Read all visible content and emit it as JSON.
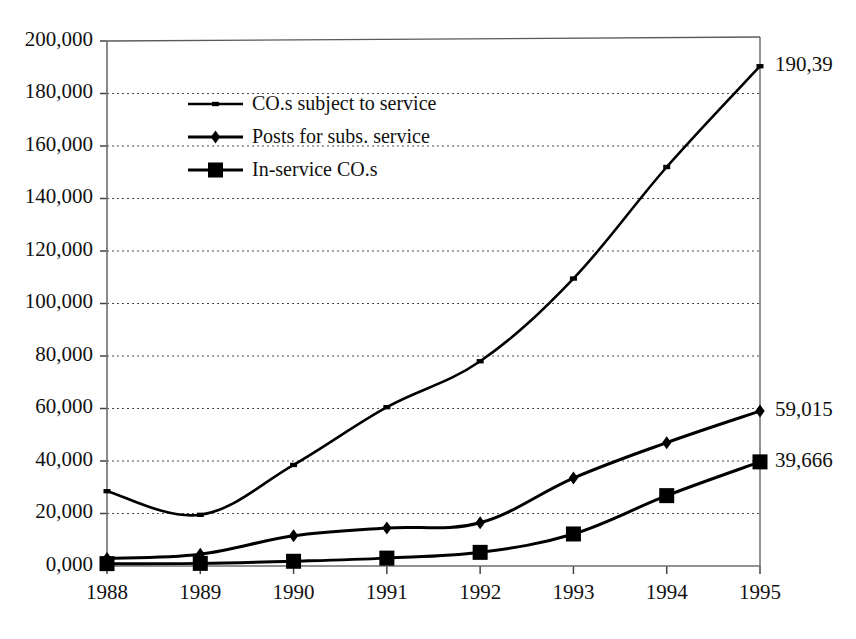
{
  "chart_data": {
    "type": "line",
    "title": "",
    "subtitle": "",
    "xlabel": "",
    "ylabel": "",
    "x": [
      "1988",
      "1989",
      "1990",
      "1991",
      "1992",
      "1993",
      "1994",
      "1995"
    ],
    "categories": [
      "1988",
      "1989",
      "1990",
      "1991",
      "1992",
      "1993",
      "1994",
      "1995"
    ],
    "ylim": [
      0,
      200000
    ],
    "ytick_values": [
      0,
      20000,
      40000,
      60000,
      80000,
      100000,
      120000,
      140000,
      160000,
      180000,
      200000
    ],
    "ytick_labels": [
      "0,000",
      "20,000",
      "40,000",
      "60,000",
      "80,000",
      "100,000",
      "120,000",
      "140,000",
      "160,000",
      "180,000",
      "200,000"
    ],
    "grid": true,
    "grid_axis": "y",
    "legend_position": "upper-left-inside",
    "series": [
      {
        "name": "CO.s subject to service",
        "marker": "small-square",
        "line_width": 2.6,
        "marker_size": 7,
        "values": [
          28500,
          19500,
          38500,
          60500,
          78000,
          109500,
          152000,
          190390
        ],
        "end_label": "190,39"
      },
      {
        "name": "Posts for subs. service",
        "marker": "diamond",
        "line_width": 3.0,
        "marker_size": 13,
        "values": [
          2900,
          4500,
          11500,
          14500,
          16500,
          33500,
          47000,
          59015
        ],
        "end_label": "59,015"
      },
      {
        "name": "In-service CO.s",
        "marker": "square",
        "line_width": 3.0,
        "marker_size": 15,
        "values": [
          900,
          1000,
          1800,
          3000,
          5200,
          12200,
          26800,
          39666
        ],
        "end_label": "39,666"
      }
    ],
    "colors": {
      "series_line": "#000000",
      "marker_fill": "#000000",
      "grid": "#4a4a4a",
      "axis": "#6e6e6e",
      "text": "#111111",
      "background": "#ffffff"
    }
  },
  "legend": {
    "entries": [
      {
        "label": "CO.s subject to service",
        "marker": "small-square"
      },
      {
        "label": "Posts for subs. service",
        "marker": "diamond"
      },
      {
        "label": "In-service CO.s",
        "marker": "square"
      }
    ]
  },
  "point_labels": {
    "series_1": "190,39",
    "series_2": "59,015",
    "series_3": "39,666"
  },
  "axis": {
    "y_labels": [
      "200,000",
      "180,000",
      "160,000",
      "140,000",
      "120,000",
      "100,000",
      "80,000",
      "60,000",
      "40,000",
      "20,000",
      "0,000"
    ],
    "x_labels": [
      "1988",
      "1989",
      "1990",
      "1991",
      "1992",
      "1993",
      "1994",
      "1995"
    ]
  }
}
